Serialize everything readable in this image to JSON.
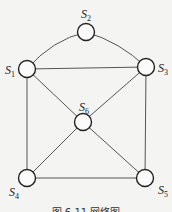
{
  "diagram": {
    "type": "undirected-graph",
    "nodes": [
      {
        "id": "S1",
        "letter": "S",
        "sub": "1"
      },
      {
        "id": "S2",
        "letter": "S",
        "sub": "2"
      },
      {
        "id": "S3",
        "letter": "S",
        "sub": "3"
      },
      {
        "id": "S4",
        "letter": "S",
        "sub": "4"
      },
      {
        "id": "S5",
        "letter": "S",
        "sub": "5"
      },
      {
        "id": "S6",
        "letter": "S",
        "sub": "6"
      }
    ],
    "edges": [
      {
        "from": "S1",
        "to": "S2"
      },
      {
        "from": "S2",
        "to": "S3"
      },
      {
        "from": "S1",
        "to": "S3"
      },
      {
        "from": "S1",
        "to": "S4"
      },
      {
        "from": "S3",
        "to": "S5"
      },
      {
        "from": "S4",
        "to": "S5"
      },
      {
        "from": "S1",
        "to": "S6"
      },
      {
        "from": "S3",
        "to": "S6"
      },
      {
        "from": "S4",
        "to": "S6"
      },
      {
        "from": "S5",
        "to": "S6"
      }
    ],
    "caption": "图 6.11  网络图"
  }
}
